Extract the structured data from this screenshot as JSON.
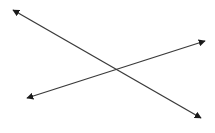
{
  "diagram": {
    "type": "intersecting-lines",
    "background": "#ffffff",
    "line_color": "#3a3a3a",
    "arrow_color": "#1a1a1a",
    "lines": [
      {
        "name": "line-a",
        "x1": 13,
        "y1": 10,
        "x2": 201,
        "y2": 118,
        "arrows": "both"
      },
      {
        "name": "line-b",
        "x1": 27,
        "y1": 98,
        "x2": 205,
        "y2": 41,
        "arrows": "both"
      }
    ],
    "intersection": {
      "x": 115,
      "y": 69
    }
  }
}
